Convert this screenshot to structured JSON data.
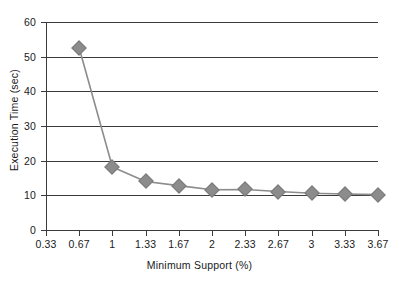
{
  "chart_data": {
    "type": "line",
    "title": "",
    "xlabel": "Minimum Support (%)",
    "ylabel": "Execution Time (sec)",
    "x_tick_labels": [
      "0.33",
      "0.67",
      "1",
      "1.33",
      "1.67",
      "2",
      "2.33",
      "2.67",
      "3",
      "3.33",
      "3.67"
    ],
    "y_tick_labels": [
      "0",
      "10",
      "20",
      "30",
      "40",
      "50",
      "60"
    ],
    "ylim": [
      0,
      60
    ],
    "y_tick_step": 10,
    "grid": "horizontal",
    "legend": "none",
    "series": [
      {
        "name": "Execution Time",
        "marker": "diamond",
        "marker_color": "#8c8c8c",
        "line_color": "#8c8c8c",
        "x": [
          "0.67",
          "1",
          "1.33",
          "1.67",
          "2",
          "2.33",
          "2.67",
          "3",
          "3.33",
          "3.67"
        ],
        "values": [
          52.5,
          18.2,
          14.0,
          12.8,
          11.6,
          11.7,
          11.1,
          10.6,
          10.4,
          10.2
        ]
      }
    ]
  },
  "colors": {
    "axis": "#3b3b3b",
    "text": "#1a1a1a",
    "series": "#8c8c8c",
    "background": "#ffffff"
  }
}
